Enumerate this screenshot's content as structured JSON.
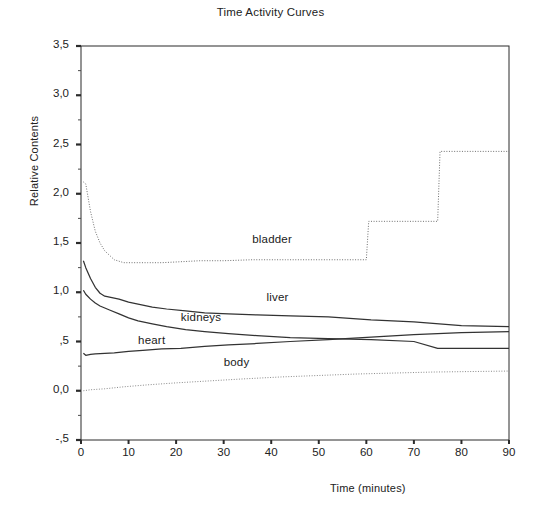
{
  "chart_data": {
    "type": "line",
    "title": "Time Activity Curves",
    "xlabel": "Time (minutes)",
    "ylabel": "Relative Contents",
    "xlim": [
      0,
      90
    ],
    "ylim": [
      -0.5,
      3.5
    ],
    "grid": false,
    "legend_position": "inline-annotations",
    "xticks": [
      0,
      10,
      20,
      30,
      40,
      50,
      60,
      70,
      80,
      90
    ],
    "xtick_labels": [
      "0",
      "10",
      "20",
      "30",
      "40",
      "50",
      "60",
      "70",
      "80",
      "90"
    ],
    "yticks": [
      -0.5,
      0.0,
      0.5,
      1.0,
      1.5,
      2.0,
      2.5,
      3.0,
      3.5
    ],
    "ytick_labels": [
      "-,5",
      "0,0",
      ",5",
      "1,0",
      "1,5",
      "2,0",
      "2,5",
      "3,0",
      "3,5"
    ],
    "minor_yticks": [
      -0.25,
      0.25,
      0.75,
      1.25,
      1.75,
      2.25,
      2.75,
      3.25
    ],
    "decimal_separator": ",",
    "series": [
      {
        "name": "bladder",
        "label": "bladder",
        "style": "dotted",
        "color": "#6f6f6f",
        "label_x": 36,
        "label_y": 1.52,
        "x": [
          0.5,
          1,
          2,
          3,
          4,
          5,
          7,
          9,
          11,
          14,
          17,
          21,
          25,
          30,
          36,
          43,
          52,
          60,
          60.5,
          75,
          75.5,
          90
        ],
        "y": [
          2.12,
          2.1,
          1.82,
          1.62,
          1.5,
          1.42,
          1.33,
          1.3,
          1.3,
          1.3,
          1.3,
          1.31,
          1.32,
          1.32,
          1.33,
          1.33,
          1.33,
          1.33,
          1.72,
          1.72,
          2.43,
          2.43
        ]
      },
      {
        "name": "liver",
        "label": "liver",
        "style": "solid",
        "color": "#333333",
        "label_x": 39,
        "label_y": 0.93,
        "x": [
          0.5,
          1,
          2,
          3,
          4,
          5,
          6,
          8,
          10,
          12,
          15,
          18,
          22,
          26,
          31,
          37,
          44,
          52,
          61,
          70,
          80,
          90
        ],
        "y": [
          1.32,
          1.25,
          1.14,
          1.05,
          0.99,
          0.96,
          0.95,
          0.93,
          0.9,
          0.88,
          0.85,
          0.83,
          0.81,
          0.79,
          0.78,
          0.77,
          0.76,
          0.75,
          0.72,
          0.7,
          0.66,
          0.65
        ]
      },
      {
        "name": "kidneys",
        "label": "kidneys",
        "style": "solid",
        "color": "#333333",
        "label_x": 21,
        "label_y": 0.73,
        "x": [
          0.5,
          1,
          2,
          3,
          4,
          5,
          6,
          8,
          10,
          12,
          15,
          18,
          22,
          26,
          31,
          37,
          44,
          52,
          61,
          70,
          75,
          80,
          90
        ],
        "y": [
          1.02,
          0.98,
          0.93,
          0.89,
          0.86,
          0.84,
          0.82,
          0.78,
          0.74,
          0.71,
          0.68,
          0.65,
          0.62,
          0.6,
          0.58,
          0.56,
          0.54,
          0.53,
          0.52,
          0.5,
          0.43,
          0.43,
          0.43
        ]
      },
      {
        "name": "heart",
        "label": "heart",
        "style": "solid",
        "color": "#333333",
        "label_x": 12,
        "label_y": 0.5,
        "x": [
          0.5,
          1,
          2,
          3,
          5,
          7,
          10,
          13,
          17,
          21,
          26,
          31,
          37,
          44,
          52,
          61,
          70,
          80,
          90
        ],
        "y": [
          0.38,
          0.36,
          0.37,
          0.375,
          0.38,
          0.385,
          0.4,
          0.41,
          0.425,
          0.43,
          0.45,
          0.465,
          0.48,
          0.5,
          0.52,
          0.545,
          0.57,
          0.59,
          0.6
        ]
      },
      {
        "name": "body",
        "label": "body",
        "style": "dotted",
        "color": "#8a8a8a",
        "label_x": 30,
        "label_y": 0.27,
        "x": [
          0.5,
          2,
          5,
          9,
          14,
          20,
          27,
          34,
          42,
          50,
          58,
          66,
          74,
          82,
          90
        ],
        "y": [
          0.0,
          0.01,
          0.02,
          0.04,
          0.06,
          0.08,
          0.1,
          0.12,
          0.14,
          0.155,
          0.17,
          0.18,
          0.19,
          0.195,
          0.2
        ]
      }
    ]
  }
}
